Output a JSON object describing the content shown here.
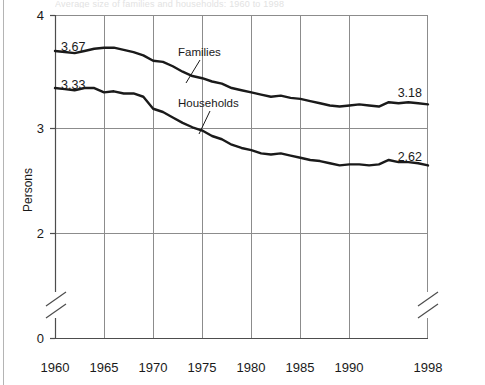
{
  "figure": {
    "caption_fragment": "Average size of families and households: 1960 to 1998",
    "colors": {
      "line": "#1a1a1a",
      "grid": "#8c8c8c",
      "axis": "#4d4d4d",
      "text": "#1a1a1a",
      "background": "#ffffff"
    }
  },
  "chart_data": {
    "type": "line",
    "title": "",
    "xlabel": "",
    "ylabel": "Persons",
    "xlim": [
      1960,
      1998
    ],
    "ylim": [
      2.0,
      4.0
    ],
    "y_axis_break": true,
    "y_break_between": [
      0,
      2
    ],
    "grid": true,
    "legend_position": "inline-annotation",
    "ytick_labels": [
      "0",
      "2",
      "3",
      "4"
    ],
    "ytick_values": [
      0,
      2,
      3,
      4
    ],
    "xtick_labels": [
      "1960",
      "1965",
      "1970",
      "1975",
      "1980",
      "1985",
      "1990",
      "1998"
    ],
    "xtick_values": [
      1960,
      1965,
      1970,
      1975,
      1980,
      1985,
      1990,
      1998
    ],
    "x": [
      1960,
      1961,
      1962,
      1963,
      1964,
      1965,
      1966,
      1967,
      1968,
      1969,
      1970,
      1971,
      1972,
      1973,
      1974,
      1975,
      1976,
      1977,
      1978,
      1979,
      1980,
      1981,
      1982,
      1983,
      1984,
      1985,
      1986,
      1987,
      1988,
      1989,
      1990,
      1991,
      1992,
      1993,
      1994,
      1995,
      1996,
      1997,
      1998
    ],
    "series": [
      {
        "name": "Families",
        "start_label": "3.67",
        "end_label": "3.18",
        "start_value": 3.67,
        "end_value": 3.18,
        "values": [
          3.67,
          3.66,
          3.65,
          3.67,
          3.69,
          3.7,
          3.7,
          3.68,
          3.66,
          3.63,
          3.58,
          3.57,
          3.53,
          3.48,
          3.44,
          3.42,
          3.39,
          3.37,
          3.33,
          3.31,
          3.29,
          3.27,
          3.25,
          3.26,
          3.24,
          3.23,
          3.21,
          3.19,
          3.17,
          3.16,
          3.17,
          3.18,
          3.17,
          3.16,
          3.2,
          3.19,
          3.2,
          3.19,
          3.18
        ]
      },
      {
        "name": "Households",
        "start_label": "3.33",
        "end_label": "2.62",
        "start_value": 3.33,
        "end_value": 2.62,
        "values": [
          3.33,
          3.32,
          3.31,
          3.33,
          3.33,
          3.29,
          3.3,
          3.28,
          3.28,
          3.25,
          3.14,
          3.11,
          3.06,
          3.01,
          2.97,
          2.94,
          2.89,
          2.86,
          2.81,
          2.78,
          2.76,
          2.73,
          2.72,
          2.73,
          2.71,
          2.69,
          2.67,
          2.66,
          2.64,
          2.62,
          2.63,
          2.63,
          2.62,
          2.63,
          2.67,
          2.65,
          2.65,
          2.64,
          2.62
        ]
      }
    ],
    "annotations": [
      {
        "text": "Families",
        "points_to": "families-line"
      },
      {
        "text": "Households",
        "points_to": "households-line"
      }
    ]
  }
}
